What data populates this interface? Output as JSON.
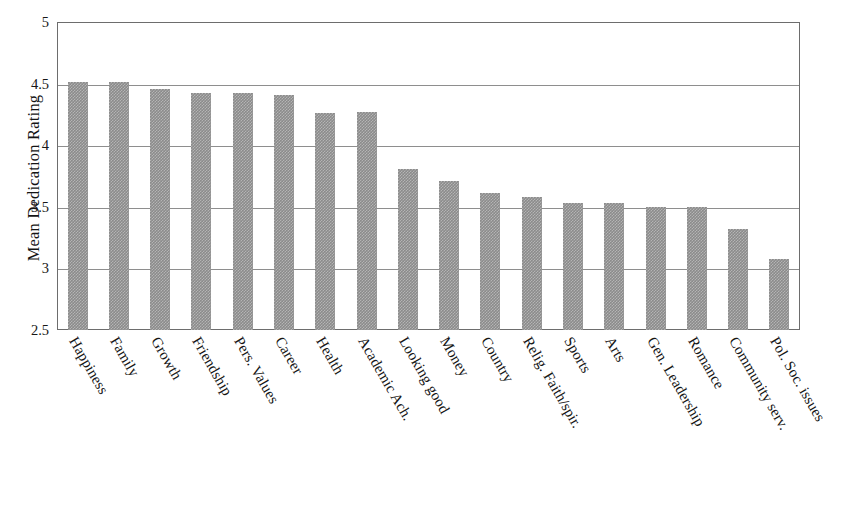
{
  "chart_data": {
    "type": "bar",
    "title": "",
    "subtitle": "",
    "xlabel": "",
    "ylabel": "Mean Dedication Rating",
    "ylim": [
      2.5,
      5
    ],
    "y_ticks": [
      "2.5",
      "3",
      "3.5",
      "4",
      "4.5",
      "5"
    ],
    "y_tick_values": [
      2.5,
      3,
      3.5,
      4,
      4.5,
      5
    ],
    "grid": true,
    "legend": "none",
    "orientation": "vertical",
    "bar_color": "#8b8b8b",
    "bar_pattern": "checkered-gray",
    "axis_color": "#6d6d6d",
    "categories": [
      "Happiness",
      "Family",
      "Growth",
      "Friendship",
      "Pers. Values",
      "Career",
      "Health",
      "Academic Ach.",
      "Looking good",
      "Money",
      "Country",
      "Relig. Faith/spir.",
      "Sports",
      "Arts",
      "Gen. Leadership",
      "Romance",
      "Community serv.",
      "Pol. Soc. issues"
    ],
    "values": [
      4.51,
      4.51,
      4.46,
      4.42,
      4.42,
      4.41,
      4.26,
      4.27,
      3.81,
      3.71,
      3.61,
      3.58,
      3.53,
      3.53,
      3.5,
      3.5,
      3.32,
      3.08
    ]
  }
}
